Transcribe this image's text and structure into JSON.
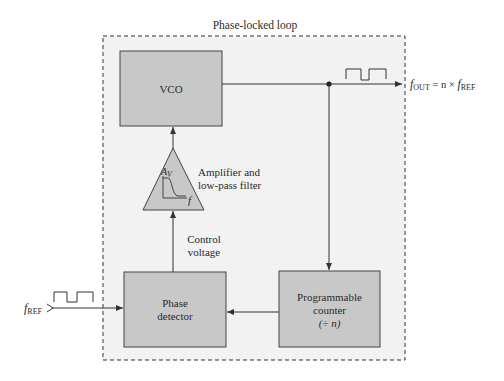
{
  "diagram": {
    "title": "Phase-locked loop",
    "colors": {
      "block_fill": "#c8c8c8",
      "block_stroke": "#444444",
      "boundary_fill": "#f2f2f2",
      "line": "#333333"
    },
    "blocks": {
      "vco": {
        "label": "VCO"
      },
      "amplifier": {
        "label_line1": "Amplifier and",
        "label_line2": "low-pass filter",
        "symbol_gain": "A",
        "symbol_gain_sub": "V",
        "symbol_freq": "f"
      },
      "phase_detector": {
        "label_line1": "Phase",
        "label_line2": "detector"
      },
      "counter": {
        "label_line1": "Programmable",
        "label_line2": "counter",
        "label_line3": "(÷ n)"
      }
    },
    "signals": {
      "control_voltage_line1": "Control",
      "control_voltage_line2": "voltage",
      "input": {
        "symbol": "f",
        "sub": "REF"
      },
      "output": {
        "symbol": "f",
        "sub": "OUT",
        "equation_mid": " = n × ",
        "rhs_symbol": "f",
        "rhs_sub": "REF"
      }
    }
  }
}
